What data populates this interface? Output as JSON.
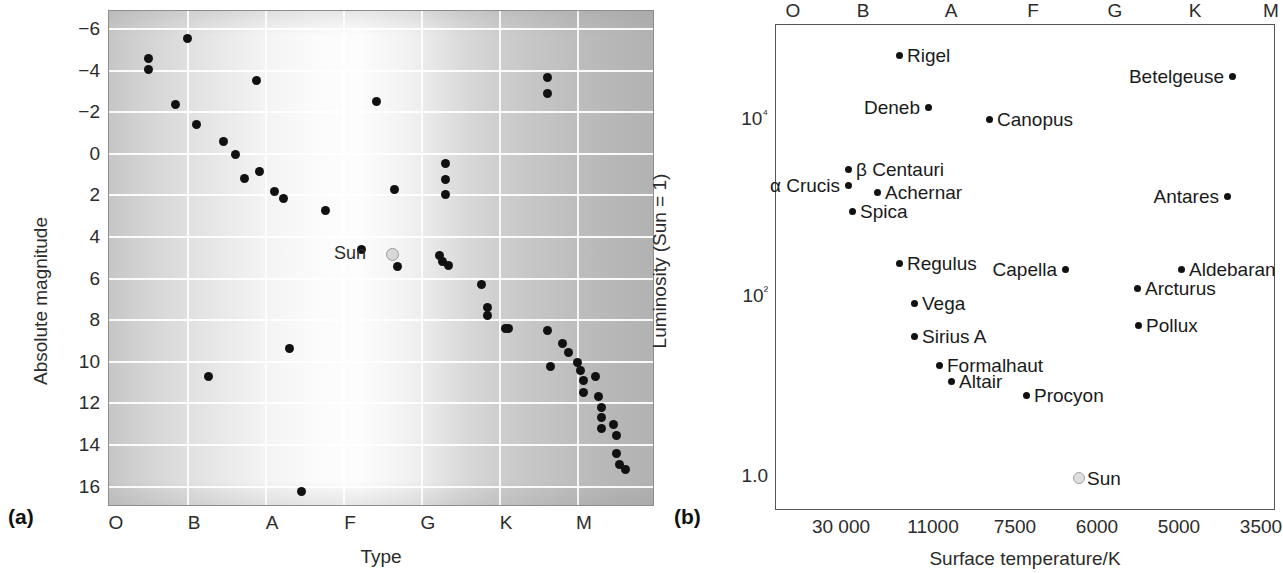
{
  "figure": {
    "panel_a_tag": "(a)",
    "panel_b_tag": "(b)"
  },
  "panel_a": {
    "ylabel": "Absolute magnitude",
    "xlabel": "Type",
    "yticks": [
      "−6",
      "−4",
      "−2",
      "0",
      "2",
      "4",
      "6",
      "8",
      "10",
      "12",
      "14",
      "16"
    ],
    "xticks": [
      "O",
      "B",
      "A",
      "F",
      "G",
      "K",
      "M"
    ],
    "sun_label": "Sun"
  },
  "panel_b": {
    "ylabel": "Luminosity (Sun = 1)",
    "xlabel": "Surface temperature/K",
    "xticks_top": [
      "O",
      "B",
      "A",
      "F",
      "G",
      "K",
      "M"
    ],
    "xticks_bottom": [
      "30 000",
      "11000",
      "7500",
      "6000",
      "5000",
      "3500"
    ],
    "yticks": [
      "10⁴",
      "10²",
      "1.0"
    ],
    "sun_label": "Sun"
  },
  "chart_data": [
    {
      "type": "scatter",
      "panel": "a",
      "title": "",
      "xlabel": "Type",
      "ylabel": "Absolute magnitude",
      "xtick_labels": [
        "O",
        "B",
        "A",
        "F",
        "G",
        "K",
        "M"
      ],
      "ytick_values": [
        -6,
        -4,
        -2,
        0,
        2,
        4,
        6,
        8,
        10,
        12,
        14,
        16
      ],
      "ylim": [
        -6.9,
        17.2
      ],
      "y_inverted": true,
      "grid": true,
      "legend": "none",
      "background": "grey gradient, light band around type A-F",
      "points": [
        {
          "x": "B0",
          "y": -5.7
        },
        {
          "x": "O7",
          "y": -2.9
        },
        {
          "x": "O7",
          "y": -2.5
        },
        {
          "x": "B2",
          "y": -4.0
        },
        {
          "x": "A2",
          "y": -3.2
        },
        {
          "x": "O9",
          "y": -1.3
        },
        {
          "x": "B0",
          "y": -1.0
        },
        {
          "x": "B3",
          "y": -0.2
        },
        {
          "x": "B5",
          "y": 0.5
        },
        {
          "x": "B6",
          "y": 1.5
        },
        {
          "x": "A0",
          "y": 2.1
        },
        {
          "x": "A1",
          "y": 1.6
        },
        {
          "x": "A2",
          "y": 2.6
        },
        {
          "x": "F0",
          "y": 2.9
        },
        {
          "x": "F8",
          "y": -0.3
        },
        {
          "x": "K0",
          "y": -0.2
        },
        {
          "x": "K0",
          "y": 0.5
        },
        {
          "x": "K0",
          "y": 1.7
        },
        {
          "x": "M0",
          "y": -4.0
        },
        {
          "x": "M0",
          "y": -3.1
        },
        {
          "x": "G0",
          "y": 4.8
        },
        {
          "x": "G3",
          "y": 6.1
        },
        {
          "x": "K1",
          "y": 5.9
        },
        {
          "x": "K1",
          "y": 6.1
        },
        {
          "x": "K1",
          "y": 6.2
        },
        {
          "x": "K4",
          "y": 7.1
        },
        {
          "x": "K4",
          "y": 7.9
        },
        {
          "x": "K4",
          "y": 8.2
        },
        {
          "x": "K6",
          "y": 8.7
        },
        {
          "x": "L0",
          "y": 8.6
        },
        {
          "x": "M0",
          "y": 9.6
        },
        {
          "x": "M1",
          "y": 10.2
        },
        {
          "x": "M1",
          "y": 10.6
        },
        {
          "x": "M0",
          "y": 11.1
        },
        {
          "x": "M2",
          "y": 10.8
        },
        {
          "x": "M2",
          "y": 11.1
        },
        {
          "x": "M2",
          "y": 11.5
        },
        {
          "x": "M2",
          "y": 11.9
        },
        {
          "x": "M3",
          "y": 11.4
        },
        {
          "x": "M3",
          "y": 12.1
        },
        {
          "x": "M3",
          "y": 12.5
        },
        {
          "x": "M3",
          "y": 12.9
        },
        {
          "x": "M3",
          "y": 13.3
        },
        {
          "x": "M4",
          "y": 13.1
        },
        {
          "x": "M4",
          "y": 13.5
        },
        {
          "x": "M4",
          "y": 14.2
        },
        {
          "x": "M4",
          "y": 14.6
        },
        {
          "x": "M5",
          "y": 14.8
        },
        {
          "x": "M5",
          "y": 16.5
        },
        {
          "x": "B4",
          "y": 10.8
        },
        {
          "x": "A3",
          "y": 10.0
        },
        {
          "x": "A4",
          "y": 14.4
        }
      ],
      "sun": {
        "x": "G0",
        "y": 4.8,
        "label": "Sun",
        "marker": "open-circle-grey"
      }
    },
    {
      "type": "scatter",
      "panel": "b",
      "title": "",
      "xlabel": "Surface temperature/K",
      "ylabel": "Luminosity (Sun = 1)",
      "xtick_labels_top": [
        "O",
        "B",
        "A",
        "F",
        "G",
        "K",
        "M"
      ],
      "xtick_labels_bottom": [
        "30 000",
        "11000",
        "7500",
        "6000",
        "5000",
        "3500"
      ],
      "ytick_labels": [
        "10⁴",
        "10²",
        "1.0"
      ],
      "ytick_values": [
        10000,
        100,
        1.0
      ],
      "yscale": "log",
      "x_inverted": true,
      "grid": false,
      "legend": "none",
      "named_stars": [
        {
          "name": "Rigel",
          "luminosity": 60000,
          "label_side": "right"
        },
        {
          "name": "Betelgeuse",
          "luminosity": 25000,
          "label_side": "left"
        },
        {
          "name": "Deneb",
          "luminosity": 16000,
          "label_side": "left"
        },
        {
          "name": "Canopus",
          "luminosity": 11000,
          "label_side": "right"
        },
        {
          "name": "β Centauri",
          "luminosity": 3500,
          "label_side": "right"
        },
        {
          "name": "α Crucis",
          "luminosity": 2500,
          "label_side": "left"
        },
        {
          "name": "Achernar",
          "luminosity": 1800,
          "label_side": "right"
        },
        {
          "name": "Antares",
          "luminosity": 1800,
          "label_side": "left"
        },
        {
          "name": "Spica",
          "luminosity": 1200,
          "label_side": "right"
        },
        {
          "name": "Regulus",
          "luminosity": 220,
          "label_side": "right"
        },
        {
          "name": "Capella",
          "luminosity": 180,
          "label_side": "left"
        },
        {
          "name": "Aldebaran",
          "luminosity": 180,
          "label_side": "right"
        },
        {
          "name": "Arcturus",
          "luminosity": 130,
          "label_side": "right"
        },
        {
          "name": "Vega",
          "luminosity": 80,
          "label_side": "right"
        },
        {
          "name": "Pollux",
          "luminosity": 60,
          "label_side": "right"
        },
        {
          "name": "Sirius A",
          "luminosity": 40,
          "label_side": "right"
        },
        {
          "name": "Formalhaut",
          "luminosity": 20,
          "label_side": "right"
        },
        {
          "name": "Altair",
          "luminosity": 14,
          "label_side": "right"
        },
        {
          "name": "Procyon",
          "luminosity": 9,
          "label_side": "right"
        },
        {
          "name": "Sun",
          "luminosity": 1.0,
          "label_side": "right",
          "marker": "open-circle-grey"
        }
      ]
    }
  ],
  "_layout": {
    "panel_a_points": [
      [
        26,
        30
      ],
      [
        13,
        45
      ],
      [
        13,
        53
      ],
      [
        49,
        61
      ],
      [
        89,
        77
      ],
      [
        22,
        79
      ],
      [
        29,
        94
      ],
      [
        38,
        107
      ],
      [
        42,
        117
      ],
      [
        45,
        135
      ],
      [
        55,
        145
      ],
      [
        50,
        130
      ],
      [
        58,
        150
      ],
      [
        72,
        159
      ],
      [
        95,
        143
      ],
      [
        112,
        147
      ],
      [
        112,
        136
      ],
      [
        112,
        124
      ],
      [
        146,
        59
      ],
      [
        146,
        71
      ],
      [
        84,
        188
      ],
      [
        96,
        201
      ],
      [
        110,
        193
      ],
      [
        111,
        197
      ],
      [
        113,
        200
      ],
      [
        124,
        215
      ],
      [
        126,
        232
      ],
      [
        126,
        238
      ],
      [
        132,
        248
      ],
      [
        133,
        248
      ],
      [
        146,
        249
      ],
      [
        151,
        259
      ],
      [
        153,
        266
      ],
      [
        147,
        276
      ],
      [
        156,
        273
      ],
      [
        157,
        279
      ],
      [
        158,
        287
      ],
      [
        158,
        296
      ],
      [
        162,
        284
      ],
      [
        163,
        299
      ],
      [
        164,
        307
      ],
      [
        164,
        315
      ],
      [
        164,
        323
      ],
      [
        168,
        320
      ],
      [
        169,
        328
      ],
      [
        169,
        342
      ],
      [
        170,
        350
      ],
      [
        172,
        354
      ],
      [
        172,
        392
      ],
      [
        33,
        284
      ],
      [
        60,
        263
      ],
      [
        64,
        370
      ]
    ]
  }
}
